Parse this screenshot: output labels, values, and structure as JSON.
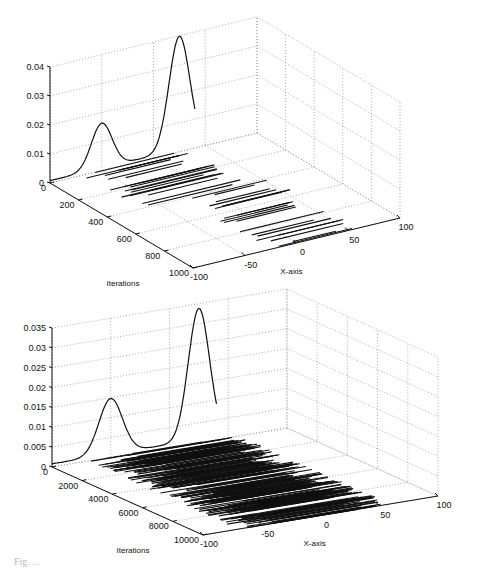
{
  "chart_data": [
    {
      "type": "line",
      "subtype": "3d-waterfall",
      "title": "",
      "xlabel": "X-axis",
      "ylabel": "Iterations",
      "zlabel": "",
      "xlim": [
        -100,
        100
      ],
      "ylim": [
        0,
        1000
      ],
      "zlim": [
        0,
        0.04
      ],
      "x_ticks": [
        -100,
        -50,
        0,
        50,
        100
      ],
      "y_ticks": [
        0,
        200,
        400,
        600,
        800,
        1000
      ],
      "z_ticks": [
        0,
        0.01,
        0.02,
        0.03,
        0.04
      ],
      "z_tick_labels": [
        "0",
        "0.01",
        "0.02",
        "0.03",
        "0.04"
      ],
      "grid": true,
      "series": [
        {
          "name": "density",
          "description": "Bimodal target density drawn on back plane (iterations = 0)",
          "peaks": [
            {
              "x": -50,
              "height": 0.0155,
              "sigma": 10
            },
            {
              "x": 25,
              "height": 0.039,
              "sigma": 10
            }
          ]
        },
        {
          "name": "sample-traces",
          "description": "Horizontal sample trajectories across iterations clustered in two groups",
          "clusters": [
            {
              "iter_range": [
                0,
                400
              ],
              "x_range": [
                -70,
                35
              ]
            },
            {
              "iter_range": [
                400,
                1000
              ],
              "x_range": [
                -30,
                60
              ]
            }
          ]
        }
      ]
    },
    {
      "type": "line",
      "subtype": "3d-waterfall",
      "title": "",
      "xlabel": "X-axis",
      "ylabel": "Iterations",
      "zlabel": "",
      "xlim": [
        -100,
        100
      ],
      "ylim": [
        0,
        10000
      ],
      "zlim": [
        0,
        0.035
      ],
      "x_ticks": [
        -100,
        -50,
        0,
        50,
        100
      ],
      "y_ticks": [
        0,
        2000,
        4000,
        6000,
        8000,
        10000
      ],
      "z_ticks": [
        0,
        0.005,
        0.01,
        0.015,
        0.02,
        0.025,
        0.03,
        0.035
      ],
      "z_tick_labels": [
        "0",
        "0.005",
        "0.01",
        "0.015",
        "0.02",
        "0.025",
        "0.03",
        "0.035"
      ],
      "grid": true,
      "series": [
        {
          "name": "density",
          "description": "Bimodal target density drawn on back plane (iterations = 0)",
          "peaks": [
            {
              "x": -50,
              "height": 0.014,
              "sigma": 10
            },
            {
              "x": 25,
              "height": 0.033,
              "sigma": 9
            }
          ]
        },
        {
          "name": "sample-traces",
          "description": "Dense horizontal sample trajectories spanning all iterations",
          "clusters": [
            {
              "iter_range": [
                0,
                10000
              ],
              "x_range": [
                -70,
                60
              ]
            }
          ]
        }
      ]
    }
  ],
  "panels": [
    {
      "origin": {
        "x": 50,
        "y": 183
      },
      "iter_end": {
        "x": 193,
        "y": 268
      },
      "x_end": {
        "x": 400,
        "y": 218
      },
      "z_top_y": 67,
      "y_labels": [
        "0",
        "200",
        "400",
        "600",
        "800",
        "1000"
      ],
      "x_labels": [
        "-100",
        "-50",
        "0",
        "50",
        "100"
      ],
      "ylabel": "Iterations",
      "xlabel": "X-axis",
      "trace_count": 40,
      "seed": 7
    },
    {
      "origin": {
        "x": 52,
        "y": 467
      },
      "iter_end": {
        "x": 203,
        "y": 535
      },
      "x_end": {
        "x": 438,
        "y": 496
      },
      "z_top_y": 328,
      "y_labels": [
        "0",
        "2000",
        "4000",
        "6000",
        "8000",
        "10000"
      ],
      "x_labels": [
        "-100",
        "-50",
        "0",
        "50",
        "100"
      ],
      "ylabel": "Iterations",
      "xlabel": "X-axis",
      "trace_count": 260,
      "seed": 13
    }
  ],
  "caption": "Fig. ..."
}
